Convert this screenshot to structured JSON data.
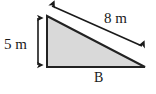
{
  "figure": {
    "type": "right-triangle-diagram",
    "shape_name": "right triangle",
    "fill_color": "#d9d9d9",
    "stroke_color": "#222222",
    "background_color": "#ffffff",
    "labels": {
      "height": "5 m",
      "hypotenuse": "8 m",
      "vertex": "B"
    },
    "measurements": [
      {
        "name": "height",
        "value": 5,
        "unit": "m",
        "text": "5 m",
        "side": "vertical-leg"
      },
      {
        "name": "hypotenuse",
        "value": 8,
        "unit": "m",
        "text": "8 m",
        "side": "hypotenuse"
      }
    ],
    "annotations": {
      "height_arrow": "double-headed-vertical-arrow",
      "hypotenuse_arrow": "double-headed-diagonal-arrow"
    },
    "vertices": {
      "apex": [
        47,
        16
      ],
      "bottom_left": [
        47,
        67
      ],
      "bottom_right": [
        145,
        67
      ]
    }
  }
}
